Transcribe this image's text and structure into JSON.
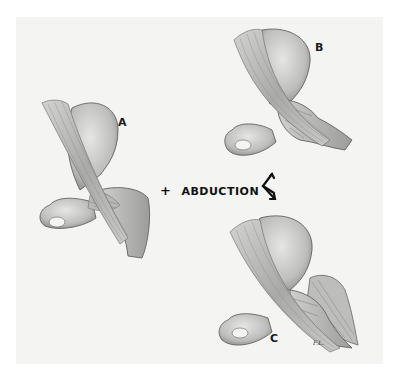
{
  "figure": {
    "panels": [
      {
        "id": "A",
        "label": "A",
        "description": "Hip joint, neutral position"
      },
      {
        "id": "B",
        "label": "B",
        "description": "Hip joint, abduction variant (upper)"
      },
      {
        "id": "C",
        "label": "C",
        "description": "Hip joint, abduction variant (lower)"
      }
    ],
    "caption": {
      "plus": "+",
      "text": "ABDUCTION"
    },
    "signature": "F.L.",
    "colors": {
      "background": "#ffffff",
      "panel": "#f4f4f3",
      "bone_light": "#d9d9d7",
      "bone_shade": "#9a9a98",
      "outline": "#4a4a4a",
      "text": "#111111"
    }
  }
}
